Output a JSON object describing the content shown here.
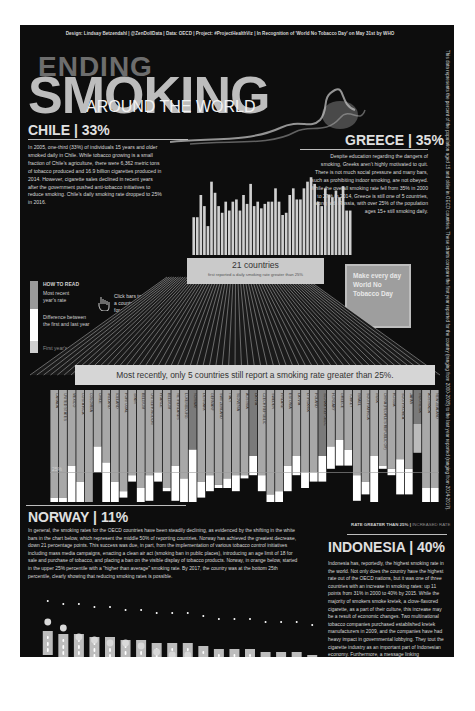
{
  "header": {
    "credits": "Design: Lindsay Betzendahl  |  @ZenDollData  |  Data: OECD  |  Project: #ProjectHealthViz  |  In Recognition of 'World No Tobacco Day' on May 31st by WHO",
    "title_line1": "ENDING",
    "title_line2": "SMOKING",
    "title_line3": "AROUND THE WORLD"
  },
  "side_note": "This data represents the percent of the population aged 15 and older in OECD countries. These charts compare the first year reported for the country (ranging from 2000-2008) to the last year reported (ranging from 2014-2017).",
  "chile": {
    "title": "CHILE | 33%",
    "text": "In 2005, one-third (33%) of individuals 15 years and older smoked daily in Chile. While tobacco growing is a small fraction of Chile's agriculture, there were 6,362 metric tons of tobacco produced and 16.9 billion cigarettes produced in 2014. However, cigarette sales declined in recent years after the government pushed anti-tobacco initiatives to reduce smoking. Chile's daily smoking rate dropped to 25% in 2016."
  },
  "greece": {
    "title": "GREECE | 35%",
    "text": "Despite education regarding the dangers of smoking, Greeks aren't highly motivated to quit. There is not much social pressure and many bars, such as prohibiting indoor smoking, are not obeyed. While the overall smoking rate fell from 35% in 2000 to 27% in 2014, Greece is still one of 5 countries, along with Russia, with over 25% of the population ages 15+ still smoking daily."
  },
  "how_to_read": {
    "title": "HOW TO READ",
    "recent": "Most recent year's rate",
    "difference": "Difference between the first and last year",
    "first": "First year's rate"
  },
  "click_hint": "Click bars to highlight a country and hover for more details!",
  "make_box": "Make every day World No Tobacco Day",
  "band21": {
    "count": "21 countries",
    "subtitle": "first reported a daily smoking rate greater than 25%"
  },
  "band5": "Most recently, only 5 countries still report a smoking rate greater than 25%.",
  "label_25": "25%",
  "legend": {
    "greater": "RATE GREATER THAN 25%",
    "sep": "|",
    "increased": "INCREASED RATE"
  },
  "norway": {
    "title": "NORWAY | 11%",
    "text": "In general, the smoking rates for the OECD countries have been steadily declining, as evidenced by the shifting in the white bars in the chart below, which represent the middle 50% of reporting countries. Norway has achieved the greatest decrease, down 21 percentage points. This success was due, in part, from the implementation of various tobacco control initiatives including mass media campaigns, enacting a clean air act (smoking ban in public places), introducing an age limit of 18 for sale and purchase of tobacco, and placing a ban on the visible display of tobacco products. Norway, in orange below, started in the upper 25% percentile with a \"higher than average\" smoking rate. By 2017, the country was at the bottom 25th percentile, clearly showing that reducing smoking rates is possible."
  },
  "indonesia": {
    "title": "INDONESIA | 40%",
    "text": "Indonesia has, reportedly, the highest smoking rate in the world. Not only does the country have the highest rate out of the OECD nations, but it was one of three countries with an increase in smoking rates: up 11 points from 31% in 2000 to 40% by 2015. While the majority of smokers smoke kretek, a clove-flavored cigarette, as a part of their culture, this increase may be a result of economic changes. Two multinational tobacco companies purchased established kretek manufacturers in 2009, and the companies have had heavy impact in governmental lobbying. They tout the cigarette industry as an important part of Indonesian economy. Furthermore, a message linking masculinity with smoking has led to massive smoking increases in t..."
  },
  "colors": {
    "background": "#0d0d0d",
    "bar_recent": "#a8a8a8",
    "bar_difference": "#ffffff",
    "bar_highlight": "#6e6e6e",
    "text": "#e0e0e0"
  },
  "chart_data": [
    {
      "type": "bar",
      "title": "Daily smoking rate, first vs last reported year (OECD, % of population 15+)",
      "categories": [
        "CANADA",
        "UNITED STATES",
        "MEXICO",
        "COSTA RICA",
        "COLOMBIA",
        "CHILE",
        "IRELAND",
        "ICELAND",
        "PORTUGAL",
        "SPAIN",
        "BELGIUM",
        "UNITED KINGDOM",
        "FRANCE",
        "BELGIUM ",
        "NETHERLANDS",
        "LUXEMBOURG",
        "NORWAY",
        "DENMARK",
        "GERMANY",
        "SWITZERLAND",
        "ITALY",
        "SLOVENIA",
        "AUSTRIA",
        "LATVIA",
        "CZECH REPUBLIC",
        "SWEDEN",
        "FINLAND",
        "ESTONIA",
        "LATVIA ",
        "LITHUANIA",
        "POLAND",
        "SLOVAK REPUBLIC",
        "HUNGARY",
        "GREECE",
        "TURKEY",
        "ISRAEL",
        "SOUTH AFRICA",
        "INDIA",
        "CHINA (PEOPLE'S REPUBLIC OF)",
        "RUSSIA",
        "SOUTH KOREA",
        "JAPAN",
        "INDONESIA",
        "AUSTRALIA",
        "NEW ZEALAND"
      ],
      "series": [
        {
          "name": "First year's rate",
          "values": [
            17,
            17,
            27,
            22,
            13,
            33,
            28,
            22,
            19,
            24,
            20,
            24,
            25,
            20,
            27,
            23,
            32,
            22,
            24,
            21,
            23,
            24,
            24,
            30,
            24,
            18,
            19,
            27,
            30,
            25,
            25,
            30,
            33,
            35,
            32,
            24,
            22,
            30,
            27,
            26,
            29,
            26,
            31,
            20,
            20
          ]
        },
        {
          "name": "Most recent year's rate",
          "values": [
            13,
            11,
            7,
            9,
            7,
            25,
            15,
            9,
            17,
            22,
            10,
            16,
            22,
            19,
            16,
            14,
            11,
            17,
            19,
            20,
            20,
            19,
            23,
            24,
            19,
            10,
            14,
            19,
            24,
            20,
            22,
            22,
            26,
            27,
            27,
            16,
            18,
            14,
            26,
            24,
            18,
            18,
            40,
            12,
            14
          ]
        }
      ],
      "annotation": "25% reference line",
      "ylabel": "Daily smoking rate (%)"
    },
    {
      "type": "box",
      "title": "Distribution of OECD daily smoking rates by year",
      "categories": [
        "2000",
        "2001",
        "2002",
        "2003",
        "2004",
        "2005",
        "2006",
        "2007",
        "2008",
        "2009",
        "2010",
        "2011",
        "2012",
        "2013",
        "2014",
        "2015",
        "2016",
        "2017"
      ],
      "series": [
        {
          "name": "Median",
          "values": [
            25,
            24,
            24,
            23,
            23,
            22,
            22,
            21,
            21,
            21,
            20,
            19,
            19,
            19,
            18,
            18,
            18,
            17
          ]
        },
        {
          "name": "Norway",
          "values": [
            32,
            30,
            27,
            26,
            25,
            25,
            24,
            22,
            21,
            21,
            19,
            17,
            16,
            16,
            13,
            13,
            12,
            11
          ]
        }
      ],
      "ylabel": "Daily smoking rate (%)"
    }
  ]
}
